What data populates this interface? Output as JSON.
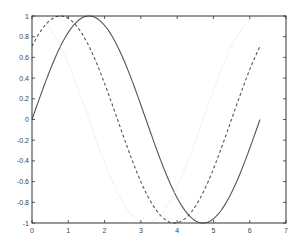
{
  "chart_data": {
    "type": "line",
    "title": "",
    "xlabel": "",
    "ylabel": "",
    "xlim": [
      0,
      7
    ],
    "ylim": [
      -1,
      1
    ],
    "grid": false,
    "legend": null,
    "x_ticks": [
      "0",
      "1",
      "2",
      "3",
      "4",
      "5",
      "6",
      "7"
    ],
    "y_ticks": [
      "-1",
      "-0.8",
      "-0.6",
      "-0.4",
      "-0.2",
      "0",
      "0.2",
      "0.4",
      "0.6",
      "0.8",
      "1"
    ],
    "x_domain": [
      0,
      6.283
    ],
    "series": [
      {
        "name": "sin(x)",
        "style": "solid",
        "color": "#555555",
        "points": [
          [
            0,
            0
          ],
          [
            0.5,
            0.479
          ],
          [
            1,
            0.841
          ],
          [
            1.5708,
            1
          ],
          [
            2,
            0.909
          ],
          [
            2.5,
            0.598
          ],
          [
            3,
            0.141
          ],
          [
            3.1416,
            0
          ],
          [
            3.5,
            -0.351
          ],
          [
            4,
            -0.757
          ],
          [
            4.7124,
            -1
          ],
          [
            5,
            -0.959
          ],
          [
            5.5,
            -0.706
          ],
          [
            6,
            -0.279
          ],
          [
            6.283,
            0
          ]
        ]
      },
      {
        "name": "sin(x+pi/4)",
        "style": "dashed",
        "color": "#555555",
        "points": [
          [
            0,
            0.707
          ],
          [
            0.5,
            0.968
          ],
          [
            0.785,
            1
          ],
          [
            1,
            0.977
          ],
          [
            1.5,
            0.767
          ],
          [
            2,
            0.386
          ],
          [
            2.356,
            0
          ],
          [
            2.5,
            -0.142
          ],
          [
            3,
            -0.514
          ],
          [
            3.5,
            -0.833
          ],
          [
            3.927,
            -1
          ],
          [
            4.5,
            -0.897
          ],
          [
            5,
            -0.624
          ],
          [
            5.5,
            -0.231
          ],
          [
            5.498,
            0
          ],
          [
            6,
            0.366
          ],
          [
            6.283,
            0.707
          ]
        ]
      },
      {
        "name": "cos(x)",
        "style": "dotted",
        "color": "#dddddd",
        "points": [
          [
            0,
            1
          ],
          [
            0.5,
            0.878
          ],
          [
            1,
            0.54
          ],
          [
            1.5708,
            0
          ],
          [
            2,
            -0.416
          ],
          [
            2.5,
            -0.801
          ],
          [
            3.1416,
            -1
          ],
          [
            3.5,
            -0.936
          ],
          [
            4,
            -0.654
          ],
          [
            4.7124,
            0
          ],
          [
            5,
            0.284
          ],
          [
            5.5,
            0.709
          ],
          [
            6,
            0.96
          ],
          [
            6.283,
            1
          ]
        ]
      }
    ]
  },
  "plot": {
    "axis_color": "#333333",
    "background": "#ffffff"
  }
}
